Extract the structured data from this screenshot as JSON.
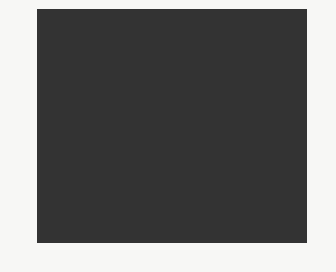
{
  "chart": {
    "type": "knitting-colorwork-chart",
    "columns": 23,
    "rows": 20,
    "colors": {
      "W": "#ffffff",
      "L": "#9b9b9b",
      "M": "#7c7c7c",
      "D": "#4d4d4d",
      "B": "#141414"
    },
    "grid_top_to_bottom": [
      "WWLLWLLWWLWLWLWLWLWLWLW",
      "WLLLLLLLWWLWLWLWLWLWLWL",
      "WLWLLLWLWWWLWLWLWLWLWLW",
      "DMMMMMMMDMMDMMDMMDMDMDM",
      "DMDDDDDMDDMDDMDDMDMDDMD",
      "DDMDDDMDDMDDMDMDMDDMDDM",
      "DDDMDMDDDDDMDDMDDMDDMDD",
      "DDDDDDDDDDMDDMDMDDMDDMD",
      "DDDMDMDDDDDMDDMDDMDDMDD",
      "DDMDDDMDDMDDMDMDMDDMDDM",
      "DMDDDDDMDDMDDMDDMDMDDMD",
      "MMMMMMMMMMMMMMMMMMMMMMM",
      "WLWLLLWLWWWLWLWLWLWLWLW",
      "WLLLLLLLWWLWLWLWLWLWLWL",
      "WWLLWLLWWLWLWLWLWLWLWLW",
      "BBBBBBBBBBBBBBBBBBBBBBB",
      "LLBBLLLLLLBBLLLLBBLLLLL",
      "LBLLBLBBLBLLBLBBLBLLBLB",
      "LBLLBLBBLBLLBLBBLBLLBLB",
      "LLBBLLLLLLBBLLLLBBLLLLL"
    ],
    "left_row_labels": [
      "20",
      "18",
      "16",
      "14",
      "12",
      "10",
      "8",
      "6",
      "4",
      "2"
    ],
    "right_row_labels": [
      "19",
      "17",
      "15",
      "13",
      "11",
      "9",
      "7",
      "5",
      "3",
      "1"
    ],
    "bottom_column_labels": [
      "23",
      "21",
      "19",
      "17",
      "15",
      "13",
      "11",
      "9",
      "7",
      "5",
      "3",
      "1"
    ]
  }
}
